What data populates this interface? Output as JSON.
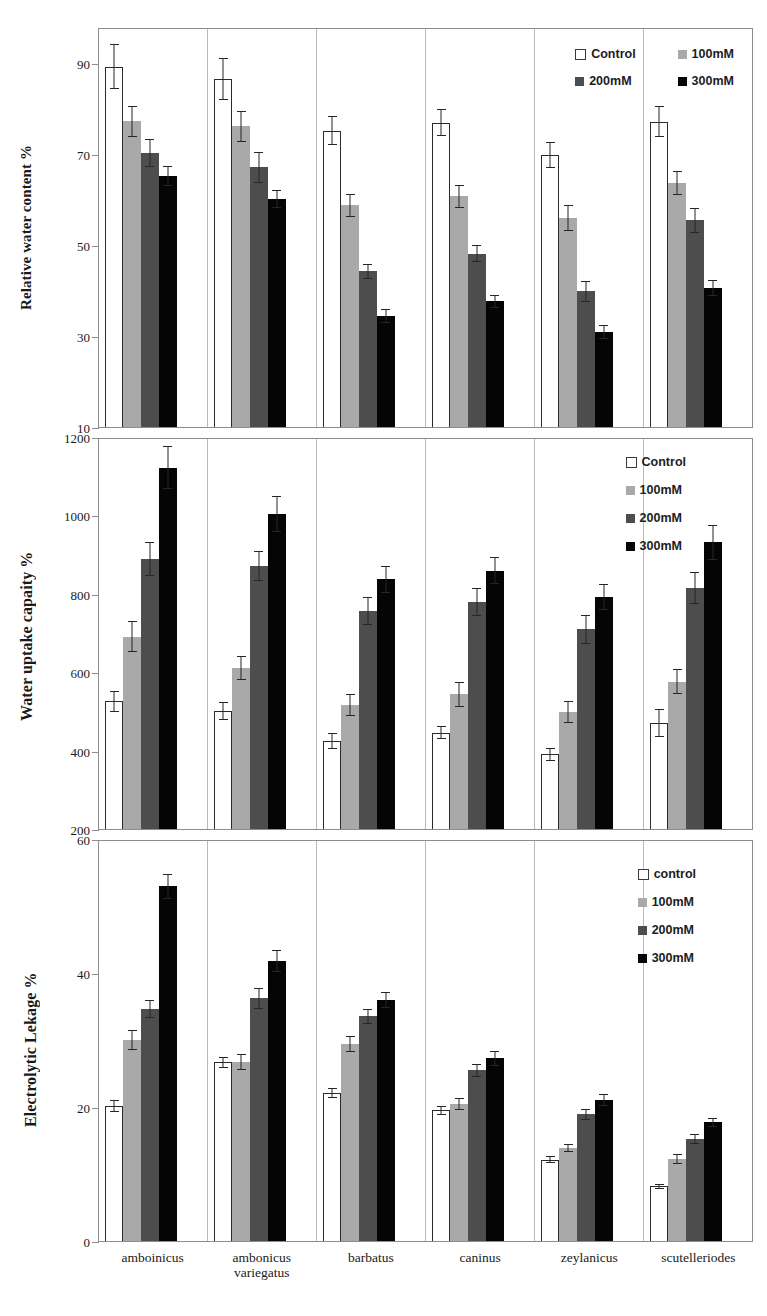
{
  "chart_data": [
    {
      "type": "bar",
      "panel": "a",
      "title": "",
      "ylabel": "Relative water content  %",
      "xlabel": "",
      "ylim": [
        10,
        98
      ],
      "yticks": [
        10,
        30,
        50,
        70,
        90
      ],
      "grid": false,
      "legend_position": "top-right",
      "legend_layout": "2x2",
      "categories": [
        "amboinicus",
        "ambonicus variegatus",
        "barbatus",
        "caninus",
        "zeylanicus",
        "scutelleriodes"
      ],
      "series": [
        {
          "name": "Control",
          "color": "#ffffff",
          "values": [
            89.7,
            87.0,
            75.5,
            77.3,
            70.2,
            77.5
          ],
          "errors": [
            5.0,
            4.7,
            3.2,
            3.0,
            2.9,
            3.4
          ]
        },
        {
          "name": "100mM",
          "color": "#a9a9a9",
          "values": [
            77.6,
            76.5,
            59.0,
            61.0,
            56.2,
            64.0
          ],
          "errors": [
            3.4,
            3.4,
            2.5,
            2.5,
            2.8,
            2.6
          ]
        },
        {
          "name": "200mM",
          "color": "#4d4d4d",
          "values": [
            70.6,
            67.4,
            44.4,
            48.3,
            40.0,
            55.7
          ],
          "errors": [
            3.0,
            3.4,
            1.7,
            1.9,
            2.3,
            2.7
          ]
        },
        {
          "name": "300mM",
          "color": "#050505",
          "values": [
            65.5,
            60.4,
            34.5,
            37.8,
            31.0,
            40.8
          ],
          "errors": [
            2.2,
            1.9,
            1.5,
            1.5,
            1.5,
            1.8
          ]
        }
      ]
    },
    {
      "type": "bar",
      "panel": "b",
      "title": "",
      "ylabel": "Water uptake capaity %",
      "xlabel": "",
      "ylim": [
        200,
        1200
      ],
      "yticks": [
        200,
        400,
        600,
        800,
        1000,
        1200
      ],
      "grid": false,
      "legend_position": "top-right",
      "legend_layout": "column",
      "categories": [
        "amboinicus",
        "ambonicus variegatus",
        "barbatus",
        "caninus",
        "zeylanicus",
        "scutelleriodes"
      ],
      "series": [
        {
          "name": "Control",
          "color": "#ffffff",
          "values": [
            527,
            502,
            425,
            447,
            392,
            472
          ],
          "errors": [
            28,
            23,
            21,
            17,
            17,
            36
          ]
        },
        {
          "name": "100mM",
          "color": "#a9a9a9",
          "values": [
            693,
            613,
            518,
            545,
            500,
            578
          ],
          "errors": [
            40,
            30,
            27,
            32,
            27,
            33
          ]
        },
        {
          "name": "200mM",
          "color": "#4d4d4d",
          "values": [
            893,
            875,
            758,
            781,
            712,
            818
          ],
          "errors": [
            44,
            38,
            36,
            36,
            37,
            40
          ]
        },
        {
          "name": "300mM",
          "color": "#050505",
          "values": [
            1126,
            1008,
            840,
            862,
            795,
            935
          ],
          "errors": [
            55,
            46,
            35,
            35,
            33,
            45
          ]
        }
      ]
    },
    {
      "type": "bar",
      "panel": "c",
      "title": "",
      "ylabel": "Electrolytic Lekage %",
      "xlabel": "",
      "ylim": [
        0,
        60
      ],
      "yticks": [
        0,
        20,
        40,
        60
      ],
      "grid": false,
      "legend_position": "top-right",
      "legend_layout": "column",
      "categories": [
        "amboinicus",
        "ambonicus variegatus",
        "barbatus",
        "caninus",
        "zeylanicus",
        "scutelleriodes"
      ],
      "series": [
        {
          "name": "control",
          "color": "#ffffff",
          "values": [
            20.2,
            26.8,
            22.2,
            19.6,
            12.2,
            8.2
          ],
          "errors": [
            0.9,
            0.8,
            0.7,
            0.7,
            0.5,
            0.4
          ]
        },
        {
          "name": "100mM",
          "color": "#a9a9a9",
          "values": [
            30.2,
            26.9,
            29.6,
            20.6,
            14.0,
            12.3
          ],
          "errors": [
            1.5,
            1.2,
            1.2,
            0.9,
            0.6,
            0.7
          ]
        },
        {
          "name": "200mM",
          "color": "#4d4d4d",
          "values": [
            34.8,
            36.4,
            33.7,
            25.6,
            19.0,
            15.3
          ],
          "errors": [
            1.4,
            1.6,
            1.1,
            1.0,
            0.8,
            0.7
          ]
        },
        {
          "name": "300mM",
          "color": "#050505",
          "values": [
            53.2,
            42.0,
            36.2,
            27.4,
            21.2,
            17.8
          ],
          "errors": [
            1.9,
            1.7,
            1.2,
            1.1,
            0.9,
            0.7
          ]
        }
      ]
    }
  ],
  "panels": {
    "a": {
      "ylabel": "Relative water content  %",
      "yticks": [
        "90",
        "70",
        "50",
        "30",
        "10"
      ],
      "legend": [
        {
          "label": "Control",
          "swatch": "control"
        },
        {
          "label": "100mM",
          "swatch": "c100"
        },
        {
          "label": "200mM",
          "swatch": "c200"
        },
        {
          "label": "300mM",
          "swatch": "c300"
        }
      ]
    },
    "b": {
      "ylabel": "Water uptake capaity %",
      "yticks": [
        "1200",
        "1000",
        "800",
        "600",
        "400",
        "200"
      ],
      "legend": [
        {
          "label": "Control",
          "swatch": "control"
        },
        {
          "label": "100mM",
          "swatch": "c100"
        },
        {
          "label": "200mM",
          "swatch": "c200"
        },
        {
          "label": "300mM",
          "swatch": "c300"
        }
      ]
    },
    "c": {
      "ylabel": "Electrolytic Lekage %",
      "yticks": [
        "60",
        "40",
        "20",
        "0"
      ],
      "legend": [
        {
          "label": "control",
          "swatch": "control"
        },
        {
          "label": "100mM",
          "swatch": "c100"
        },
        {
          "label": "200mM",
          "swatch": "c200"
        },
        {
          "label": "300mM",
          "swatch": "c300"
        }
      ]
    }
  },
  "xaxis": {
    "labels": [
      "amboinicus",
      "ambonicus variegatus",
      "barbatus",
      "caninus",
      "zeylanicus",
      "scutelleriodes"
    ]
  },
  "colors": {
    "control": "#ffffff",
    "c100": "#a9a9a9",
    "c200": "#4d4d4d",
    "c300": "#050505",
    "axis": "#8d8d8d"
  }
}
